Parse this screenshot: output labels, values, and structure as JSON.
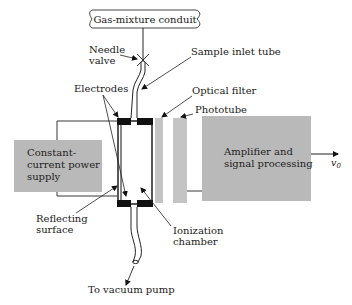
{
  "diagram": {
    "colors": {
      "box_fill": "#b9b9b9",
      "strip_fill": "#c4c4c4",
      "electrode": "#111111",
      "line": "#222222"
    },
    "conduit": {
      "label": "Gas-mixture conduit"
    },
    "labels": {
      "needle_valve_1": "Needle",
      "needle_valve_2": "valve",
      "sample_inlet_tube": "Sample inlet tube",
      "electrodes": "Electrodes",
      "optical_filter": "Optical filter",
      "phototube": "Phototube",
      "reflecting_surface_1": "Reflecting",
      "reflecting_surface_2": "surface",
      "ionization_chamber_1": "Ionization",
      "ionization_chamber_2": "chamber",
      "vacuum_pump": "To vacuum pump",
      "output_symbol": "v",
      "output_subscript": "0"
    },
    "power_supply": {
      "line1": "Constant-",
      "line2": "current power",
      "line3": "supply"
    },
    "amplifier": {
      "line1": "Amplifier and",
      "line2": "signal processing"
    }
  }
}
